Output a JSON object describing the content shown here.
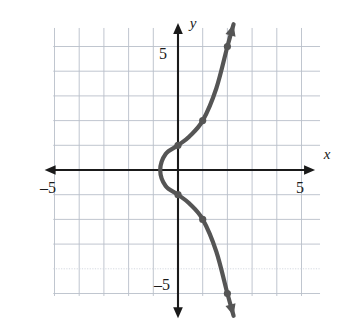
{
  "chart_data": {
    "type": "line",
    "title": "",
    "xlabel": "x",
    "ylabel": "y",
    "xlim": [
      -5.4,
      5.4
    ],
    "ylim": [
      -5.8,
      5.8
    ],
    "grid": true,
    "grid_step": 1,
    "legend": "none",
    "axis_arrows": [
      "left",
      "right",
      "up",
      "down"
    ],
    "x_tick_labels": [
      {
        "value": -5,
        "text": "–5"
      },
      {
        "value": 5,
        "text": "5"
      }
    ],
    "y_tick_labels": [
      {
        "value": 5,
        "text": "5"
      },
      {
        "value": -5,
        "text": "–5"
      }
    ],
    "series": [
      {
        "name": "curve",
        "color": "#555555",
        "marked_points": [
          {
            "x": 0,
            "y": 1
          },
          {
            "x": 1,
            "y": 2
          },
          {
            "x": 2,
            "y": 5
          },
          {
            "x": 0,
            "y": -1
          },
          {
            "x": 1,
            "y": -2
          },
          {
            "x": 2,
            "y": -5
          }
        ],
        "path_points": [
          {
            "x": 2.25,
            "y": 5.9
          },
          {
            "x": 2.0,
            "y": 5.0
          },
          {
            "x": 1.55,
            "y": 3.3
          },
          {
            "x": 1.0,
            "y": 2.0
          },
          {
            "x": 0.45,
            "y": 1.35
          },
          {
            "x": 0.0,
            "y": 1.0
          },
          {
            "x": -0.5,
            "y": 0.65
          },
          {
            "x": -0.72,
            "y": 0.0
          },
          {
            "x": -0.5,
            "y": -0.65
          },
          {
            "x": 0.0,
            "y": -1.0
          },
          {
            "x": 0.45,
            "y": -1.35
          },
          {
            "x": 1.0,
            "y": -2.0
          },
          {
            "x": 1.55,
            "y": -3.3
          },
          {
            "x": 2.0,
            "y": -5.0
          },
          {
            "x": 2.25,
            "y": -5.9
          }
        ],
        "end_arrows": [
          "start",
          "end"
        ]
      }
    ]
  },
  "labels": {
    "y_axis": "y",
    "x_axis": "x",
    "x_neg_five": "–5",
    "x_pos_five": "5",
    "y_pos_five": "5",
    "y_neg_five": "–5"
  },
  "colors": {
    "curve": "#555555",
    "axis": "#1a1a1a",
    "grid": "#b9bfc9",
    "grid_faint": "#cfd4dc",
    "background": "#ffffff"
  }
}
